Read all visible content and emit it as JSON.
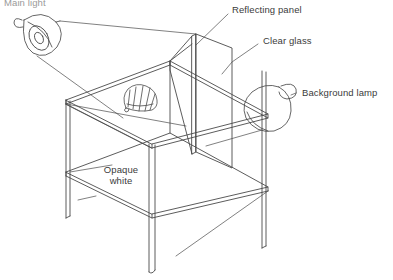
{
  "diagram": {
    "stroke_color": "#4a4a4a",
    "background_color": "#ffffff",
    "labels": {
      "main_light": "Main light",
      "reflecting_panel": "Reflecting panel",
      "clear_glass": "Clear glass",
      "background_lamp": "Background lamp",
      "opaque_white": "Opaque\nwhite",
      "opaque_white_line1": "Opaque",
      "opaque_white_line2": "white"
    },
    "parts": {
      "main_light_icon": "cone-lamp",
      "background_lamp_icon": "bell-lamp",
      "subject_icon": "scallop-shell",
      "table_icon": "glass-top-table",
      "panel_icon": "reflecting-panel"
    }
  }
}
